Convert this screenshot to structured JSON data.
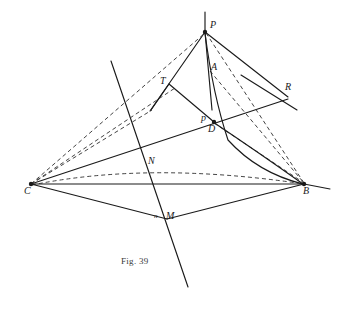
{
  "figure": {
    "caption": "Fig. 39",
    "caption_x": 121,
    "caption_y": 256,
    "width": 350,
    "height": 309,
    "background_color": "#ffffff",
    "stroke_color": "#1a1a1a",
    "dash_color": "#3a3a3a"
  },
  "points": [
    {
      "id": "P",
      "label": "P",
      "x": 205,
      "y": 32,
      "label_x": 210,
      "label_y": 20,
      "dot": true
    },
    {
      "id": "A",
      "label": "A",
      "x": 209,
      "y": 70,
      "label_x": 211,
      "label_y": 62,
      "dot": false
    },
    {
      "id": "T",
      "label": "T",
      "x": 169,
      "y": 84,
      "label_x": 160,
      "label_y": 76,
      "dot": false
    },
    {
      "id": "R",
      "label": "R",
      "x": 281,
      "y": 95,
      "label_x": 285,
      "label_y": 82,
      "dot": false
    },
    {
      "id": "p",
      "label": "p",
      "x": 209,
      "y": 120,
      "label_x": 201,
      "label_y": 113,
      "dot": false
    },
    {
      "id": "D",
      "label": "D",
      "x": 214,
      "y": 122,
      "label_x": 208,
      "label_y": 124,
      "dot": true
    },
    {
      "id": "N",
      "label": "N",
      "x": 147,
      "y": 168,
      "label_x": 148,
      "label_y": 156,
      "dot": false
    },
    {
      "id": "C",
      "label": "C",
      "x": 31,
      "y": 184,
      "label_x": 24,
      "label_y": 186,
      "dot": true
    },
    {
      "id": "B",
      "label": "B",
      "x": 304,
      "y": 184,
      "label_x": 303,
      "label_y": 186,
      "dot": true
    },
    {
      "id": "n",
      "label": "n",
      "x": 157,
      "y": 218,
      "label_x": 154,
      "label_y": 213,
      "dot": false,
      "small": true
    },
    {
      "id": "M",
      "label": "M",
      "x": 167,
      "y": 218,
      "label_x": 166,
      "label_y": 211,
      "dot": false
    }
  ],
  "solid_lines": [
    {
      "name": "vertical-axis-above-P",
      "x1": 205,
      "y1": 12,
      "x2": 205,
      "y2": 32
    },
    {
      "name": "P-to-A-to-D",
      "x1": 205,
      "y1": 32,
      "x2": 212,
      "y2": 110
    },
    {
      "name": "P-to-left-arrow",
      "x1": 205,
      "y1": 32,
      "x2": 150,
      "y2": 111
    },
    {
      "name": "P-to-R-line",
      "x1": 205,
      "y1": 32,
      "x2": 288,
      "y2": 97
    },
    {
      "name": "T-to-D",
      "x1": 169,
      "y1": 84,
      "x2": 214,
      "y2": 122
    },
    {
      "name": "T-to-arrowtip",
      "x1": 169,
      "y1": 84,
      "x2": 151,
      "y2": 110
    },
    {
      "name": "R-transversal",
      "x1": 241,
      "y1": 75,
      "x2": 297,
      "y2": 110
    },
    {
      "name": "C-to-D-extended-R",
      "x1": 31,
      "y1": 184,
      "x2": 288,
      "y2": 99
    },
    {
      "name": "C-to-B-base",
      "x1": 31,
      "y1": 184,
      "x2": 304,
      "y2": 184
    },
    {
      "name": "C-to-M",
      "x1": 31,
      "y1": 184,
      "x2": 167,
      "y2": 219
    },
    {
      "name": "M-to-B",
      "x1": 167,
      "y1": 219,
      "x2": 304,
      "y2": 184
    },
    {
      "name": "B-to-right-tail",
      "x1": 304,
      "y1": 184,
      "x2": 330,
      "y2": 189
    },
    {
      "name": "long-transversal",
      "x1": 111,
      "y1": 61,
      "x2": 188,
      "y2": 287
    }
  ],
  "dashed_lines": [
    {
      "name": "C-to-P",
      "x1": 31,
      "y1": 184,
      "x2": 205,
      "y2": 33
    },
    {
      "name": "C-to-T-ray",
      "x1": 31,
      "y1": 184,
      "x2": 175,
      "y2": 88
    },
    {
      "name": "C-to-arrow-ray",
      "x1": 31,
      "y1": 184,
      "x2": 152,
      "y2": 110
    },
    {
      "name": "P-to-B-dash",
      "x1": 206,
      "y1": 33,
      "x2": 304,
      "y2": 183
    },
    {
      "name": "A-to-B-dash",
      "x1": 210,
      "y1": 71,
      "x2": 304,
      "y2": 183
    },
    {
      "name": "D-to-B-dash",
      "x1": 214,
      "y1": 123,
      "x2": 304,
      "y2": 183
    }
  ],
  "dashed_curves": [
    {
      "name": "C-N-B-dashed-arc",
      "d": "M 32 185 Q 150 161 304 184"
    }
  ],
  "solid_curves": [
    {
      "name": "P-A-D-B-curve",
      "d": "M 205 33 Q 213 95 228 140 Q 258 173 303 184"
    },
    {
      "name": "D-to-B-curve",
      "d": "M 213 122 Q 255 150 303 184"
    }
  ],
  "chart_data": {
    "type": "diagram",
    "title": "Fig. 39"
  }
}
